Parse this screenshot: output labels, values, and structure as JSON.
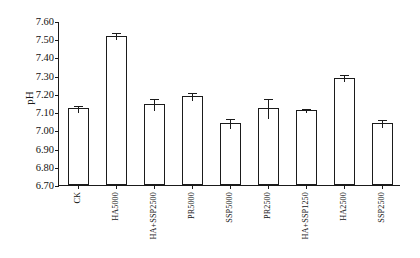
{
  "chart_data": {
    "type": "bar",
    "title": "",
    "subtitle": "",
    "xlabel": "",
    "ylabel": "pH",
    "ylim": [
      6.7,
      7.6
    ],
    "ytick_step": 0.1,
    "yticks": [
      "7.60",
      "7.50",
      "7.40",
      "7.30",
      "7.20",
      "7.10",
      "7.00",
      "6.90",
      "6.80",
      "6.70"
    ],
    "ytick_values": [
      7.6,
      7.5,
      7.4,
      7.3,
      7.2,
      7.1,
      7.0,
      6.9,
      6.8,
      6.7
    ],
    "grid": false,
    "legend": null,
    "legend_position": "none",
    "bar_fill_color": "#ffffff",
    "bar_edge_color": "#1b1b1b",
    "axis_color": "#1a1a1a",
    "categories": [
      "CK",
      "HA5000",
      "HA+SSP2500",
      "PR5000",
      "SSP5000",
      "PR2500",
      "HA+SSP1250",
      "HA2500",
      "SSP2500"
    ],
    "values": [
      7.12,
      7.52,
      7.145,
      7.19,
      7.04,
      7.12,
      7.11,
      7.29,
      7.04
    ],
    "errors": [
      0.018,
      0.018,
      0.035,
      0.022,
      0.03,
      0.055,
      0.012,
      0.018,
      0.022
    ],
    "series": [
      {
        "name": "pH",
        "values": [
          7.12,
          7.52,
          7.145,
          7.19,
          7.04,
          7.12,
          7.11,
          7.29,
          7.04
        ],
        "errors": [
          0.018,
          0.018,
          0.035,
          0.022,
          0.03,
          0.055,
          0.012,
          0.018,
          0.022
        ]
      }
    ]
  }
}
